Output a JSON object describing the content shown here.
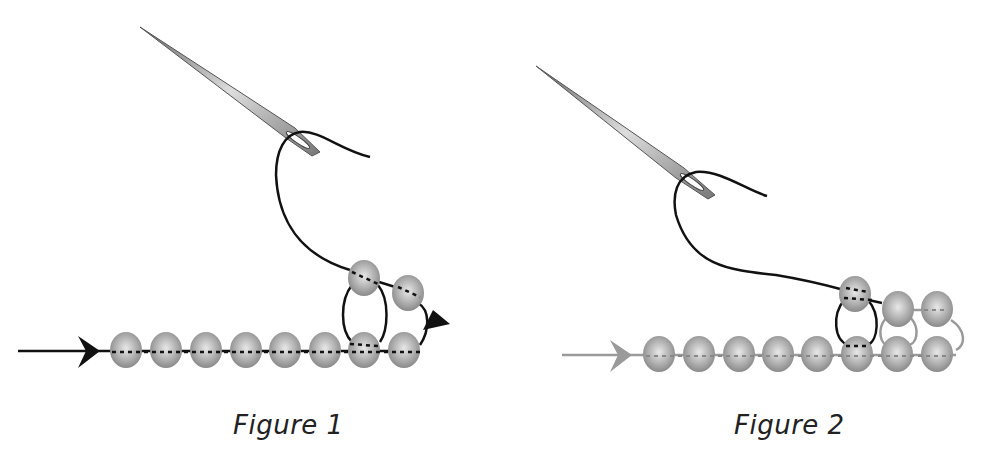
{
  "figures": [
    {
      "caption": "Figure 1",
      "thread_color": "#111111",
      "bead_count_bottom_row": 8,
      "beads_top": 2
    },
    {
      "caption": "Figure 2",
      "thread_color": "#111111",
      "prior_thread_color": "#9a9a9a",
      "bead_count_bottom_row": 8,
      "beads_top": 3
    }
  ],
  "colors": {
    "bead_fill": "#a8a8a8",
    "bead_highlight": "#e6e6e6",
    "needle": "#8c8c8c"
  }
}
